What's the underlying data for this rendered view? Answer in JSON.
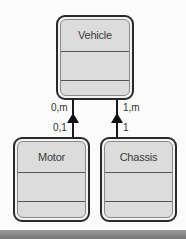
{
  "diagram": {
    "type": "uml-class-aggregation",
    "classes": [
      {
        "id": "vehicle",
        "name": "Vehicle"
      },
      {
        "id": "motor",
        "name": "Motor"
      },
      {
        "id": "chassis",
        "name": "Chassis"
      }
    ],
    "relations": [
      {
        "from": "motor",
        "to": "vehicle",
        "arrow": "filled-triangle",
        "multiplicity_top": "0,m",
        "multiplicity_bottom": "0,1"
      },
      {
        "from": "chassis",
        "to": "vehicle",
        "arrow": "filled-triangle",
        "multiplicity_top": "1,m",
        "multiplicity_bottom": "1"
      }
    ]
  },
  "colors": {
    "box_fill": "#dcdcdc",
    "box_border": "#2a2a2a",
    "line": "#1a1a1a",
    "bottom_bar": "#888888"
  }
}
